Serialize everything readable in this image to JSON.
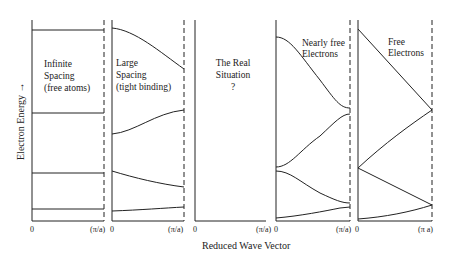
{
  "axes": {
    "y_label": "Electron Energy →",
    "x_label": "Reduced Wave Vector"
  },
  "panels": [
    {
      "id": "infinite-spacing",
      "title_lines": [
        "Infinite",
        "Spacing",
        "(free atoms)"
      ],
      "x_start": "0",
      "x_end": "(π/a)"
    },
    {
      "id": "large-spacing",
      "title_lines": [
        "Large",
        "Spacing",
        "(tight binding)"
      ],
      "x_start": "0",
      "x_end": "(π/a)"
    },
    {
      "id": "real-situation",
      "title_lines": [
        "The Real",
        "Situation",
        "?"
      ],
      "x_start": "0",
      "x_end": "(π/a)"
    },
    {
      "id": "nearly-free",
      "title_lines": [
        "Nearly free",
        "Electrons"
      ],
      "x_start": "0",
      "x_end": "(π/a)"
    },
    {
      "id": "free-electrons",
      "title_lines": [
        "Free",
        "Electrons"
      ],
      "x_start": "0",
      "x_end": "(π a)"
    }
  ],
  "colors": {
    "ink": "#222222",
    "background": "#ffffff"
  }
}
